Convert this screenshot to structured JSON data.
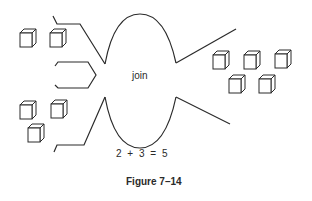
{
  "diagram": {
    "center_label": "join",
    "equation": "2 + 3 = 5",
    "caption": "Figure 7–14",
    "left_group_top": {
      "cube_count": 2
    },
    "left_group_bottom": {
      "cube_count": 3
    },
    "right_group": {
      "cube_count": 5
    },
    "stroke_color": "#2a2a2a",
    "background_color": "#ffffff"
  }
}
